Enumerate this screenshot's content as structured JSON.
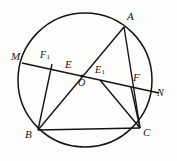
{
  "figure": {
    "kind": "euclidean-geometry-diagram",
    "background_color": "#fdfdfb",
    "stroke_color": "#141414"
  },
  "circle": {
    "name": "circumcircle",
    "cx": 85,
    "cy": 80,
    "r": 67,
    "stroke_width": 1.5
  },
  "center_dot": {
    "label": "O",
    "cx": 82,
    "cy": 76,
    "r": 1.6
  },
  "points": {
    "A": {
      "x": 124,
      "y": 27
    },
    "B": {
      "x": 38,
      "y": 130
    },
    "C": {
      "x": 140,
      "y": 128
    },
    "M": {
      "x": 24,
      "y": 62
    },
    "N": {
      "x": 158,
      "y": 92
    },
    "E": {
      "x": 74,
      "y": 70
    },
    "E1": {
      "x": 102,
      "y": 79
    },
    "F": {
      "x": 132,
      "y": 85
    },
    "F1": {
      "x": 53,
      "y": 62
    },
    "O": {
      "x": 82,
      "y": 76
    }
  },
  "segments": [
    {
      "name": "chord-MN",
      "from": "M",
      "to": "N"
    },
    {
      "name": "segment-A-B",
      "from": "A",
      "to": "B"
    },
    {
      "name": "segment-A-C",
      "from": "A",
      "to": "C"
    },
    {
      "name": "segment-B-C",
      "from": "B",
      "to": "C"
    },
    {
      "name": "segment-F1-B",
      "from": "F1",
      "to": "B"
    },
    {
      "name": "segment-F-C",
      "from": "F",
      "to": "C"
    },
    {
      "name": "segment-E1-C",
      "from": "E1",
      "to": "C"
    }
  ],
  "labels": {
    "A": {
      "text": "A",
      "sub": "",
      "x": 127,
      "y": 11
    },
    "B": {
      "text": "B",
      "sub": "",
      "x": 25,
      "y": 129
    },
    "C": {
      "text": "C",
      "sub": "",
      "x": 143,
      "y": 127
    },
    "M": {
      "text": "M",
      "sub": "",
      "x": 11,
      "y": 51
    },
    "N": {
      "text": "N",
      "sub": "",
      "x": 157,
      "y": 88
    },
    "O": {
      "text": "O",
      "sub": "",
      "x": 78,
      "y": 78
    },
    "E": {
      "text": "E",
      "sub": "",
      "x": 65,
      "y": 59
    },
    "E1": {
      "text": "E",
      "sub": "1",
      "x": 95,
      "y": 65
    },
    "F": {
      "text": "F",
      "sub": "",
      "x": 133,
      "y": 72
    },
    "F1": {
      "text": "F",
      "sub": "1",
      "x": 40,
      "y": 50
    }
  }
}
